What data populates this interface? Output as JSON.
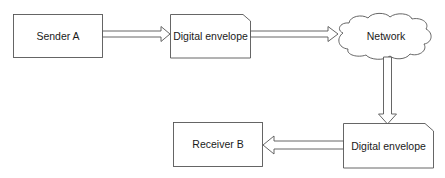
{
  "diagram": {
    "nodes": [
      {
        "id": "sender",
        "label": "Sender A",
        "shape": "rectangle"
      },
      {
        "id": "envelope1",
        "label": "Digital envelope",
        "shape": "card"
      },
      {
        "id": "network",
        "label": "Network",
        "shape": "cloud"
      },
      {
        "id": "envelope2",
        "label": "Digital envelope",
        "shape": "card"
      },
      {
        "id": "receiver",
        "label": "Receiver B",
        "shape": "rectangle"
      }
    ],
    "edges": [
      {
        "from": "sender",
        "to": "envelope1",
        "style": "block-arrow"
      },
      {
        "from": "envelope1",
        "to": "network",
        "style": "block-arrow"
      },
      {
        "from": "network",
        "to": "envelope2",
        "style": "block-arrow"
      },
      {
        "from": "envelope2",
        "to": "receiver",
        "style": "block-arrow"
      }
    ],
    "colors": {
      "stroke": "#4a4a4a",
      "fill": "#ffffff",
      "text": "#1a1a1a"
    }
  }
}
